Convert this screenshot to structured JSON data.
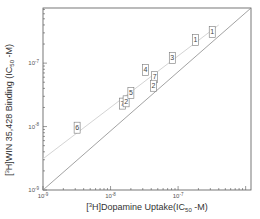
{
  "chart_data": {
    "type": "scatter",
    "title": "",
    "xlabel": "[3H]Dopamine Uptake(IC50 -M)",
    "ylabel": "[3H]WIN 35,428 Binding (IC50 -M)",
    "xscale": "log",
    "yscale": "log",
    "xlim": [
      1e-09,
      1.2e-06
    ],
    "ylim": [
      1e-09,
      7.4e-07
    ],
    "x_ticks": [
      "10-9",
      "10-8",
      "10-7"
    ],
    "y_ticks": [
      "10-9",
      "10-8",
      "10-7"
    ],
    "grid": false,
    "legend": null,
    "points": [
      {
        "label": "6",
        "x": 3.2e-09,
        "y": 9.6e-09
      },
      {
        "label": "7",
        "x": 1.5e-08,
        "y": 2.3e-08
      },
      {
        "label": "2",
        "x": 1.7e-08,
        "y": 2.5e-08
      },
      {
        "label": "5",
        "x": 2e-08,
        "y": 3.4e-08
      },
      {
        "label": "4",
        "x": 3.3e-08,
        "y": 7.8e-08
      },
      {
        "label": "7",
        "x": 4.5e-08,
        "y": 6e-08
      },
      {
        "label": "2",
        "x": 4.3e-08,
        "y": 4.4e-08
      },
      {
        "label": "3",
        "x": 8.2e-08,
        "y": 1.2e-07
      },
      {
        "label": "1",
        "x": 1.8e-07,
        "y": 2.3e-07
      },
      {
        "label": "1",
        "x": 3.2e-07,
        "y": 3.1e-07
      }
    ],
    "lines": [
      {
        "name": "identity (unity) line",
        "style": "solid",
        "x": [
          1e-09,
          1.2e-06
        ],
        "y": [
          1e-09,
          7.4e-07
        ]
      },
      {
        "name": "regression fit",
        "style": "faint",
        "x": [
          1e-09,
          4e-07
        ],
        "y": [
          3.1e-09,
          4e-07
        ]
      }
    ]
  },
  "axes": {
    "x_title_main": "[",
    "x_title_sup": "3",
    "x_title_mid": "H]Dopamine Uptake(IC",
    "x_title_sub": "50",
    "x_title_end": " -M)",
    "y_title_main": "[",
    "y_title_sup": "3",
    "y_title_mid": "H]WIN 35,428 Binding (IC",
    "y_title_sub": "50",
    "y_title_end": " -M)",
    "tick_base": "10",
    "x_tick_exps": [
      "-9",
      "-8",
      "-7"
    ],
    "y_tick_exps": [
      "-9",
      "-8",
      "-7"
    ]
  },
  "colors": {
    "axis": "#555555",
    "identity_line": "#8a8a8a",
    "fit_line": "#d4d4d4",
    "box": "#777777"
  }
}
